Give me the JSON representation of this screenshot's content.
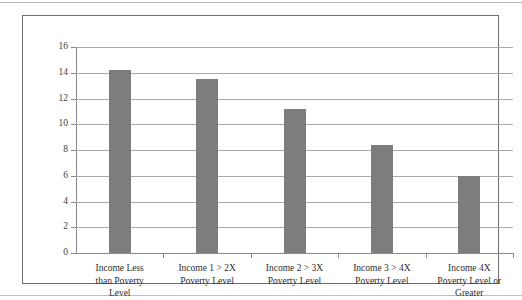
{
  "figure": {
    "background_color": "#ffffff",
    "frame_color": "#6f6f6f",
    "bar_color": "#7d7d7d",
    "gridline_color": "#a9a9a9",
    "axis_color": "#8a8a8a"
  },
  "chart_data": {
    "type": "bar",
    "title": "",
    "subtitle": "",
    "xlabel": "",
    "ylabel": "",
    "categories": [
      "Income Less than Poverty Level",
      "Income 1 > 2X Poverty Level",
      "Income 2 > 3X Poverty Level",
      "Income 3 > 4X Poverty Level",
      "Income 4X Poverty Level or Greater"
    ],
    "category_lines": [
      [
        "Income Less",
        "than Poverty",
        "Level"
      ],
      [
        "Income 1 > 2X",
        "Poverty Level"
      ],
      [
        "Income 2 > 3X",
        "Poverty Level"
      ],
      [
        "Income 3 > 4X",
        "Poverty Level"
      ],
      [
        "Income 4X",
        "Poverty Level or",
        "Greater"
      ]
    ],
    "values": [
      14.2,
      13.5,
      11.2,
      8.4,
      6.0
    ],
    "ylim": [
      0,
      16
    ],
    "ytick_step": 2,
    "ytick_labels": [
      "0",
      "2",
      "4",
      "6",
      "8",
      "10",
      "12",
      "14",
      "16"
    ],
    "grid": true,
    "grid_axis": "y",
    "legend": null,
    "legend_position": "none",
    "annotations": []
  }
}
